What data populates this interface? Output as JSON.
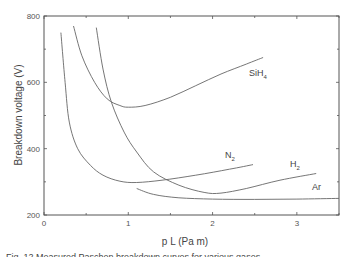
{
  "chart_data": {
    "type": "line",
    "title": "",
    "xlabel": "p L (Pa m)",
    "ylabel": "Breakdown voltage (V)",
    "xlim": [
      0,
      3.5
    ],
    "ylim": [
      200,
      800
    ],
    "xticks": [
      0,
      1,
      2,
      3
    ],
    "yticks": [
      200,
      400,
      600,
      800
    ],
    "grid": false,
    "legend": "inline labels",
    "series": [
      {
        "name": "SiH4",
        "label_main": "SiH",
        "label_sub": "4",
        "x": [
          0.35,
          0.45,
          0.6,
          0.75,
          0.9,
          1.0,
          1.2,
          1.5,
          1.8,
          2.1,
          2.4,
          2.6
        ],
        "y": [
          770,
          680,
          600,
          550,
          530,
          525,
          530,
          555,
          590,
          625,
          655,
          675
        ]
      },
      {
        "name": "N2",
        "label_main": "N",
        "label_sub": "2",
        "x": [
          0.2,
          0.25,
          0.3,
          0.4,
          0.55,
          0.7,
          0.9,
          1.1,
          1.4,
          1.8,
          2.2,
          2.48
        ],
        "y": [
          750,
          600,
          480,
          400,
          350,
          320,
          302,
          298,
          305,
          320,
          338,
          352
        ]
      },
      {
        "name": "H2",
        "label_main": "H",
        "label_sub": "2",
        "x": [
          0.62,
          0.7,
          0.8,
          0.95,
          1.1,
          1.3,
          1.6,
          1.9,
          2.1,
          2.4,
          2.8,
          3.23
        ],
        "y": [
          765,
          640,
          540,
          450,
          390,
          330,
          290,
          268,
          266,
          280,
          305,
          325
        ]
      },
      {
        "name": "Ar",
        "label_main": "Ar",
        "label_sub": "",
        "x": [
          1.1,
          1.3,
          1.6,
          2.0,
          2.5,
          3.0,
          3.5
        ],
        "y": [
          280,
          262,
          252,
          248,
          247,
          248,
          250
        ]
      }
    ]
  },
  "caption": "Fig. 12 Measured Paschen breakdown curves for various gases"
}
